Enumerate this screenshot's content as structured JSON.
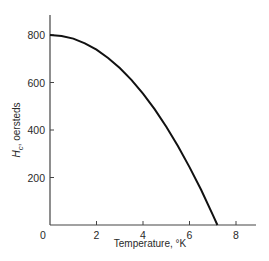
{
  "chart_data": {
    "type": "line",
    "title": "",
    "xlabel": "Temperature, °K",
    "ylabel": "H_c, oersteds",
    "ylabel_main": "H",
    "ylabel_sub": "c",
    "ylabel_rest": ", oersteds",
    "xlim": [
      0,
      8.8
    ],
    "ylim": [
      0,
      880
    ],
    "x_ticks": [
      0,
      2,
      4,
      6,
      8
    ],
    "x_tick_labels": [
      "0",
      "2",
      "4",
      "6",
      "8"
    ],
    "y_ticks": [
      200,
      400,
      600,
      800
    ],
    "y_tick_labels": [
      "200",
      "400",
      "600",
      "800"
    ],
    "grid": false,
    "legend": null,
    "series": [
      {
        "name": "Critical field Hc(T)",
        "color": "#111111",
        "x": [
          0,
          0.5,
          1,
          1.5,
          2,
          2.5,
          3,
          3.5,
          4,
          4.5,
          5,
          5.5,
          6,
          6.5,
          7,
          7.2
        ],
        "y": [
          800,
          796,
          785,
          765,
          738,
          703,
          661,
          611,
          553,
          488,
          414,
          333,
          244,
          148,
          43,
          0
        ]
      }
    ]
  }
}
